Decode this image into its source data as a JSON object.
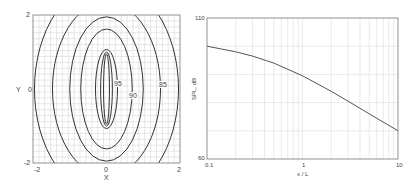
{
  "chart_data": [
    {
      "type": "contour",
      "title": "",
      "xlabel": "X",
      "ylabel": "Y",
      "xlim": [
        -2,
        2
      ],
      "ylim": [
        -2,
        2
      ],
      "x_ticks": [
        "-2",
        "0",
        "2"
      ],
      "y_ticks": [
        "-2",
        "0",
        "2"
      ],
      "grid": true,
      "contour_labels": [
        {
          "text": "95",
          "x": 0.3,
          "y": 0.15
        },
        {
          "text": "90",
          "x": 0.72,
          "y": -0.17
        },
        {
          "text": "85",
          "x": 1.55,
          "y": 0.13
        }
      ],
      "contours": [
        {
          "level": 100,
          "rx": 0.08,
          "ry": 0.95
        },
        {
          "level": 100,
          "rx": 0.16,
          "ry": 1.0
        },
        {
          "level": 95,
          "rx": 0.3,
          "ry": 1.07
        },
        {
          "level": 90,
          "rx": 0.7,
          "ry": 1.62
        },
        {
          "level": 87.5,
          "rx": 1.0,
          "ry": 1.95
        },
        {
          "level": 85,
          "rx": 1.47,
          "ry": 2.35
        },
        {
          "level": 80,
          "rx": 1.96,
          "ry": 2.9
        }
      ]
    },
    {
      "type": "line",
      "title": "",
      "xlabel": "x / L",
      "ylabel": "SPL, dB",
      "xscale": "log",
      "xlim": [
        0.1,
        10
      ],
      "ylim": [
        60,
        110
      ],
      "x_ticks": [
        "0.1",
        "1",
        "10"
      ],
      "y_ticks": [
        "60",
        "110"
      ],
      "grid": true,
      "series": [
        {
          "name": "SPL",
          "x": [
            0.1,
            0.2,
            0.3,
            0.5,
            1,
            2,
            3,
            5,
            10
          ],
          "y": [
            100,
            98,
            96.5,
            94,
            89.5,
            84,
            80.5,
            76,
            70
          ]
        }
      ]
    }
  ],
  "left_plot": {
    "xlabel": "X",
    "ylabel": "Y",
    "x_tick_min": "-2",
    "x_tick_mid": "0",
    "x_tick_max": "2",
    "y_tick_min": "-2",
    "y_tick_mid": "0",
    "y_tick_max": "2",
    "label_95": "95",
    "label_90": "90",
    "label_85": "85"
  },
  "right_plot": {
    "xlabel": "x / L",
    "ylabel": "SPL, dB",
    "x_tick_min": "0.1",
    "x_tick_mid": "1",
    "x_tick_max": "10",
    "y_tick_min": "60",
    "y_tick_max": "110"
  }
}
